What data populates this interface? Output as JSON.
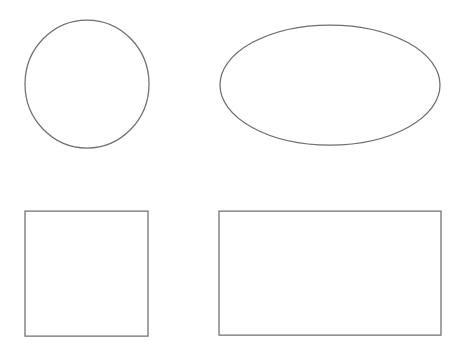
{
  "canvas": {
    "width": 466,
    "height": 362,
    "background_color": "#ffffff",
    "title": "Geometric Shapes"
  },
  "style": {
    "stroke_color": "#6f6f6f",
    "fill_color": "#ffffff",
    "stroke_width": 1.25,
    "guide_color": "#f4f4f4",
    "guide_color_soft": "#f8f8f8",
    "guide_stroke_width": 1
  },
  "layout": {
    "rows": 2,
    "columns": 2,
    "description": "Four geometric outline shapes arranged in a two by two grid"
  },
  "shapes": [
    {
      "id": "circle",
      "name": "circle",
      "label": "Circle",
      "row": 1,
      "column": 1,
      "geometry_type": "ellipse",
      "cx": 87,
      "cy": 84,
      "rx": 62,
      "ry": 64,
      "bounds": {
        "left": 25,
        "top": 20,
        "right": 149,
        "bottom": 148,
        "width": 124,
        "height": 128
      },
      "guides": {
        "vertical": {
          "x": 87,
          "y1": 24,
          "y2": 144
        },
        "horizontal": {
          "y": 84,
          "x1": 29,
          "x2": 145
        }
      }
    },
    {
      "id": "ellipse",
      "name": "ellipse",
      "label": "Ellipse",
      "row": 1,
      "column": 2,
      "geometry_type": "ellipse",
      "cx": 330,
      "cy": 85,
      "rx": 110,
      "ry": 60,
      "bounds": {
        "left": 220,
        "top": 25,
        "right": 440,
        "bottom": 145,
        "width": 220,
        "height": 120
      },
      "guides": {
        "vertical": {
          "x": 330,
          "y1": 29,
          "y2": 141
        },
        "horizontal": {
          "y": 85,
          "x1": 226,
          "x2": 434
        }
      }
    },
    {
      "id": "square",
      "name": "square",
      "label": "Square",
      "row": 2,
      "column": 1,
      "geometry_type": "rect",
      "x": 25,
      "y": 211,
      "width": 123,
      "height": 125,
      "bounds": {
        "left": 25,
        "top": 211,
        "right": 148,
        "bottom": 336,
        "width": 123,
        "height": 125
      },
      "guides": {
        "vertical": {
          "x": 86,
          "y1": 213,
          "y2": 334
        },
        "horizontal": {
          "y": 273,
          "x1": 27,
          "x2": 146
        }
      }
    },
    {
      "id": "rectangle",
      "name": "rectangle",
      "label": "Rectangle",
      "row": 2,
      "column": 2,
      "geometry_type": "rect",
      "x": 219,
      "y": 211,
      "width": 222,
      "height": 124,
      "bounds": {
        "left": 219,
        "top": 211,
        "right": 441,
        "bottom": 335,
        "width": 222,
        "height": 124
      },
      "guides": {
        "vertical": {
          "x": 330,
          "y1": 213,
          "y2": 333
        },
        "horizontal": {
          "y": 273,
          "x1": 221,
          "x2": 439
        }
      }
    }
  ]
}
